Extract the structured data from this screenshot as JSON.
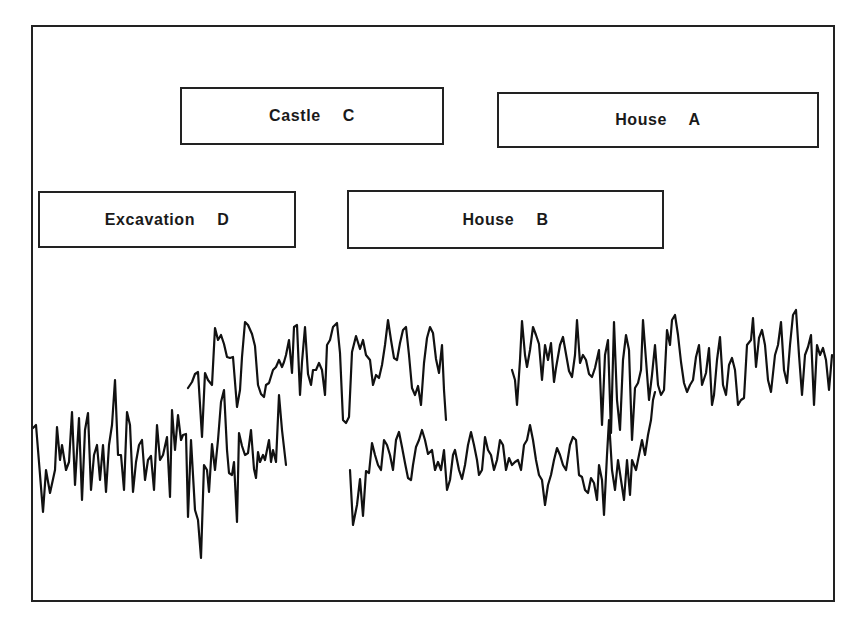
{
  "diagram": {
    "title": "",
    "labels": {
      "castle_c": "Castle  C",
      "house_a": "House  A",
      "excavation_d": "Excavation  D",
      "house_b": "House  B"
    },
    "boxes": [
      {
        "id": "castle_c",
        "label": "Castle C",
        "x": 180,
        "y": 87,
        "w": 264,
        "h": 58
      },
      {
        "id": "house_a",
        "label": "House A",
        "x": 497,
        "y": 92,
        "w": 322,
        "h": 56
      },
      {
        "id": "excavation_d",
        "label": "Excavation D",
        "x": 38,
        "y": 191,
        "w": 258,
        "h": 57
      },
      {
        "id": "house_b",
        "label": "House B",
        "x": 347,
        "y": 190,
        "w": 317,
        "h": 59
      }
    ],
    "series": [
      {
        "name": "Excavation D",
        "x_start": 33,
        "x_end": 287,
        "points": "33,428 36,425 43,512 46,470 50,493 55,470 57,427 60,460 62,445 66,470 69,462 72,412 75,485 79,418 82,500 85,430 88,413 91,490 94,455 97,445 100,480 103,445 106,492 109,445 112,425 115,380 118,455 121,455 124,490 127,412 130,425 133,492 136,462 139,445 142,440 145,480 148,460 151,456 154,490 157,425 160,460 163,455 167,437 170,497 172,410 175,450 178,415 181,440 183,435 186,434 188,517 191,440 195,510 198,520 201,558 204,465 207,470 209,492 212,444 215,470 218,440 221,402 224,390 227,450 229,473 232,475 234,462 237,522 239,433 242,446 245,455 248,453 251,430 254,469 256,478 258,452 260,462 263,455 265,460 269,440 271,462 273,450 276,462 279,395 282,430 286,465"
      },
      {
        "name": "Castle C",
        "x_start": 188,
        "x_end": 446,
        "points": "188,388 192,382 195,374 198,372 202,437 205,373 208,380 212,385 215,328 218,340 221,335 224,344 227,357 230,358 233,357 237,407 240,390 242,357 245,322 248,325 252,334 255,346 258,385 261,394 264,397 266,385 269,383 273,370 276,367 279,360 282,367 284,362 286,355 289,340 292,373 294,327 297,325 300,395 302,362 305,327 308,374 311,385 313,370 316,370 319,363 322,370 325,395 327,345 330,340 333,327 337,323 340,353 343,420 346,423 349,417 352,352 356,336 360,349 363,340 366,355 370,360 373,385 376,375 379,378 382,365 385,345 388,320 391,340 394,358 397,360 400,343 403,330 406,327 409,355 412,388 415,395 418,386 421,405 424,363 427,338 430,327 433,333 436,359 439,373 442,345 444,390 446,420"
      },
      {
        "name": "House B",
        "x_start": 350,
        "x_end": 655,
        "points": "350,470 353,525 357,505 360,479 363,516 366,471 369,473 372,443 375,455 378,465 381,470 384,440 387,445 390,455 393,470 396,440 399,432 402,447 405,463 408,478 411,480 413,465 416,447 419,440 422,430 425,440 428,454 432,450 435,470 438,462 441,470 444,450 447,490 450,480 453,455 455,450 459,470 462,479 465,465 468,445 471,432 474,445 477,460 479,475 482,470 485,437 488,450 491,455 494,470 497,460 500,440 503,445 506,470 509,458 512,465 515,462 518,460 521,470 524,445 527,440 530,425 533,440 536,460 539,475 542,480 545,505 548,485 551,475 554,460 557,448 560,455 563,465 566,470 570,445 573,437 576,440 579,475 582,477 585,490 588,493 591,478 594,483 597,500 599,465 602,480 604,515 607,455 609,420 612,470 615,490 618,460 621,480 624,500 627,460 630,495 632,460 636,470 639,455 642,440 645,455 648,435 651,420 653,400 655,392"
      },
      {
        "name": "House A",
        "x_start": 512,
        "x_end": 830,
        "points": "512,370 515,380 517,405 520,360 522,321 525,355 527,367 530,350 533,327 536,335 539,344 542,380 545,345 548,360 551,343 554,382 556,368 560,345 563,337 566,354 569,371 572,377 575,355 577,320 580,363 583,355 586,360 589,374 592,377 595,368 599,350 602,425 605,355 608,340 611,433 614,322 617,400 620,430 623,360 626,335 629,350 632,440 635,388 638,383 641,370 643,320 646,360 649,400 652,375 655,345 658,385 661,395 664,390 667,330 670,345 672,320 675,315 678,335 681,362 684,383 687,392 690,385 693,380 696,357 699,345 702,385 706,373 709,348 712,405 714,395 717,360 720,337 723,385 726,395 729,365 732,358 735,370 738,405 741,400 744,398 747,345 751,340 753,318 756,367 759,338 762,330 765,345 768,380 771,392 775,355 778,345 781,322 784,370 787,383 790,345 793,315 796,310 799,355 802,395 805,355 808,347 811,335 814,405 817,345 820,355 823,348 826,360 829,390 832,355 835,358 838,354 841,360 845,385 848,365 851,358 854,360"
      }
    ]
  }
}
